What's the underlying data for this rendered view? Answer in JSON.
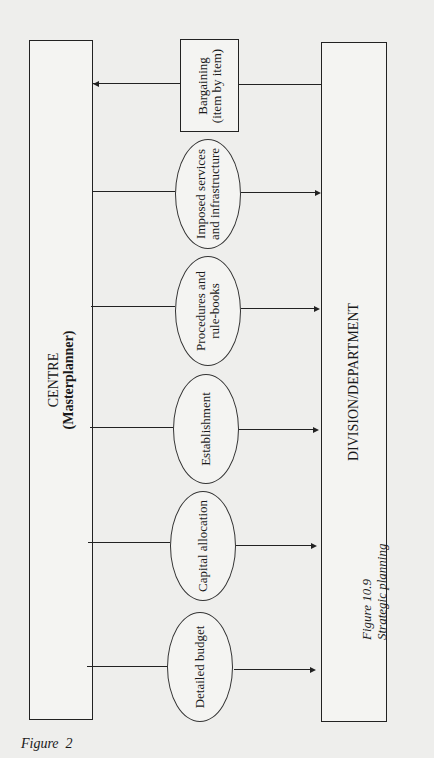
{
  "diagram": {
    "centre": {
      "title": "CENTRE",
      "subtitle": "(Masterplanner)"
    },
    "division": {
      "title": "DIVISION/DEPARTMENT"
    },
    "nodes": [
      {
        "label_line1": "Bargaining",
        "label_line2": "(item by item)",
        "shape": "rectangle",
        "direction": "division-to-centre"
      },
      {
        "label_line1": "Imposed services",
        "label_line2": "and infrastructure",
        "shape": "ellipse",
        "direction": "centre-to-division"
      },
      {
        "label_line1": "Procedures and",
        "label_line2": "rule-books",
        "shape": "ellipse",
        "direction": "centre-to-division"
      },
      {
        "label_line1": "Establishment",
        "label_line2": "",
        "shape": "ellipse",
        "direction": "centre-to-division"
      },
      {
        "label_line1": "Capital allocation",
        "label_line2": "",
        "shape": "ellipse",
        "direction": "centre-to-division"
      },
      {
        "label_line1": "Detailed budget",
        "label_line2": "",
        "shape": "ellipse",
        "direction": "centre-to-division"
      }
    ]
  },
  "figure_caption": {
    "number": "Figure 10.9",
    "title": "Strategic planning"
  },
  "page_label": "Figure  2",
  "colors": {
    "line": "#222222",
    "background": "#eeeeec"
  }
}
